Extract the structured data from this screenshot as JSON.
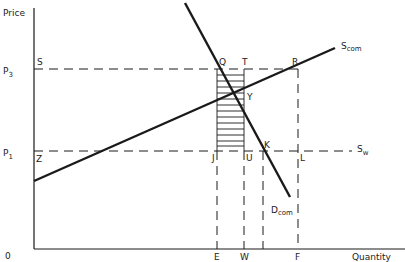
{
  "diagram": {
    "type": "supply-demand",
    "axes": {
      "y_label": "Price",
      "x_label": "Quantity",
      "origin_label": "0"
    },
    "price_levels": [
      {
        "label": "P",
        "subscript": "3",
        "y": 69
      },
      {
        "label": "P",
        "subscript": "1",
        "y": 151
      }
    ],
    "quantity_levels": [
      {
        "label": "E",
        "x": 217
      },
      {
        "label": "W",
        "x": 244
      },
      {
        "label": "",
        "x": 263
      },
      {
        "label": "F",
        "x": 298
      }
    ],
    "curves": [
      {
        "name": "S",
        "subscript": "com",
        "kind": "supply",
        "x1": 34,
        "y1": 181,
        "x2": 335,
        "y2": 48
      },
      {
        "name": "D",
        "subscript": "com",
        "kind": "demand",
        "x1": 185,
        "y1": 3,
        "x2": 290,
        "y2": 197
      },
      {
        "name": "S",
        "subscript": "w",
        "kind": "world-supply",
        "y": 151
      }
    ],
    "points": {
      "S": "S",
      "Q": "Q",
      "T": "T",
      "R": "R",
      "Y": "Y",
      "Z": "Z",
      "J": "J",
      "U": "U",
      "K": "K",
      "L": "L"
    },
    "shaded_region": {
      "x1": 217,
      "x2": 244,
      "y1": 69,
      "y2": 151,
      "pattern": "horizontal-hatch"
    },
    "colors": {
      "line": "#1a1a1a",
      "text": "#222222",
      "background": "#ffffff"
    }
  }
}
